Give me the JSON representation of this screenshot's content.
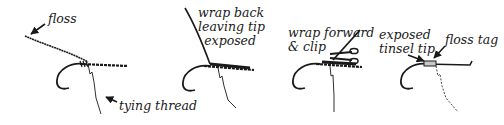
{
  "figure": {
    "ink_color": "#1a1a1a",
    "panels": [
      {
        "step": 1,
        "labels": {
          "floss": "floss",
          "thread": "tying thread"
        }
      },
      {
        "step": 2,
        "labels": {
          "line1": "wrap back",
          "line2": "leaving tip",
          "line3": "exposed"
        }
      },
      {
        "step": 3,
        "labels": {
          "line1": "wrap forward",
          "line2": "& clip"
        }
      },
      {
        "step": 4,
        "labels": {
          "tinsel_line1": "exposed",
          "tinsel_line2": "tinsel tip",
          "tag": "floss tag"
        }
      }
    ]
  }
}
